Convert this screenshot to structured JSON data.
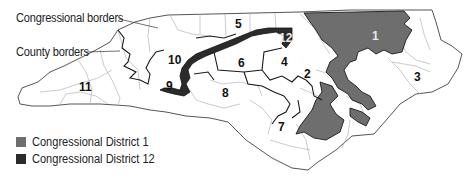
{
  "map": {
    "title": "North Carolina congressional districts",
    "callouts": {
      "congressional_borders": "Congressional borders",
      "county_borders": "County borders"
    },
    "districts": [
      {
        "label": "1",
        "x": 375,
        "y": 36
      },
      {
        "label": "2",
        "x": 306,
        "y": 74
      },
      {
        "label": "3",
        "x": 417,
        "y": 77
      },
      {
        "label": "4",
        "x": 284,
        "y": 62
      },
      {
        "label": "5",
        "x": 238,
        "y": 24
      },
      {
        "label": "6",
        "x": 241,
        "y": 63
      },
      {
        "label": "7",
        "x": 281,
        "y": 127
      },
      {
        "label": "8",
        "x": 226,
        "y": 93
      },
      {
        "label": "9",
        "x": 170,
        "y": 86
      },
      {
        "label": "10",
        "x": 175,
        "y": 60
      },
      {
        "label": "11",
        "x": 83,
        "y": 87
      },
      {
        "label": "12",
        "x": 284,
        "y": 38
      }
    ],
    "legend": [
      {
        "label": "Congressional District 1",
        "color": "#6e6e6e"
      },
      {
        "label": "Congressional District 12",
        "color": "#2b2b2b"
      }
    ],
    "colors": {
      "district_1_fill": "#6e6e6e",
      "district_12_fill": "#2b2b2b",
      "congressional_border": "#1a1a1a",
      "county_border": "#9a9a9a",
      "land": "#ffffff"
    }
  }
}
